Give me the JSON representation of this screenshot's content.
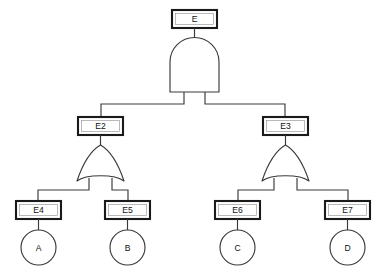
{
  "diagram": {
    "type": "fault-tree",
    "background_color": "#ffffff",
    "box_stroke_color": "#1a1a1a",
    "line_color": "#3a3a3a",
    "text_color": "#111111"
  },
  "events": {
    "top": {
      "id": "E",
      "label": "E",
      "shape": "rectangle"
    },
    "intermediate": [
      {
        "id": "E2",
        "label": "E2",
        "shape": "rectangle"
      },
      {
        "id": "E3",
        "label": "E3",
        "shape": "rectangle"
      },
      {
        "id": "E4",
        "label": "E4",
        "shape": "rectangle"
      },
      {
        "id": "E5",
        "label": "E5",
        "shape": "rectangle"
      },
      {
        "id": "E6",
        "label": "E6",
        "shape": "rectangle"
      },
      {
        "id": "E7",
        "label": "E7",
        "shape": "rectangle"
      }
    ],
    "basic": [
      {
        "id": "A",
        "label": "A",
        "shape": "circle"
      },
      {
        "id": "B",
        "label": "B",
        "shape": "circle"
      },
      {
        "id": "C",
        "label": "C",
        "shape": "circle"
      },
      {
        "id": "D",
        "label": "D",
        "shape": "circle"
      }
    ]
  },
  "gates": [
    {
      "id": "G1",
      "type": "AND",
      "parent": "E",
      "children": [
        "E2",
        "E3"
      ]
    },
    {
      "id": "G2",
      "type": "OR",
      "parent": "E2",
      "children": [
        "E4",
        "E5"
      ]
    },
    {
      "id": "G3",
      "type": "OR",
      "parent": "E3",
      "children": [
        "E6",
        "E7"
      ]
    }
  ],
  "edges": [
    {
      "from": "E4",
      "to": "A"
    },
    {
      "from": "E5",
      "to": "B"
    },
    {
      "from": "E6",
      "to": "C"
    },
    {
      "from": "E7",
      "to": "D"
    }
  ]
}
